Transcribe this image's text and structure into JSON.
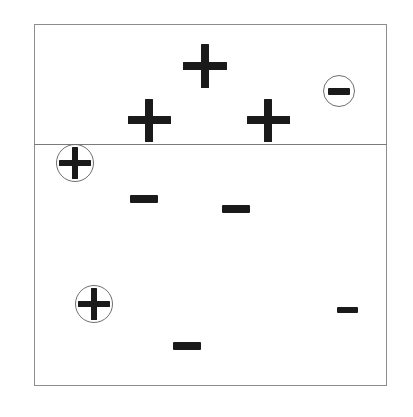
{
  "figure": {
    "width": 413,
    "height": 417,
    "background_color": "#ffffff",
    "ink_color": "#1a1a1a",
    "frame_color": "#8d8d8d",
    "boundary_color": "#7a7a7a",
    "ring_color": "#6f6f6f"
  },
  "frame": {
    "label": "plot-frame",
    "x": 34,
    "y": 24,
    "width": 353,
    "height": 362,
    "border_width": 1.4
  },
  "decision_boundary": {
    "label": "decision-boundary",
    "orientation": "horizontal",
    "x": 34,
    "y": 144,
    "width": 353,
    "thickness": 1.4
  },
  "regions": [
    {
      "name": "positive-region",
      "label": "above-boundary"
    },
    {
      "name": "negative-region",
      "label": "below-boundary"
    }
  ],
  "markers": [
    {
      "id": "plus-1",
      "sign": "+",
      "semantic": "positive-example",
      "region": "positive-region",
      "cx": 205,
      "cy": 66,
      "size": 44,
      "stroke": 8,
      "circled": false,
      "ring_radius": 0
    },
    {
      "id": "plus-2",
      "sign": "+",
      "semantic": "positive-example",
      "region": "positive-region",
      "cx": 149,
      "cy": 120,
      "size": 43,
      "stroke": 8,
      "circled": false,
      "ring_radius": 0
    },
    {
      "id": "plus-3",
      "sign": "+",
      "semantic": "positive-example",
      "region": "positive-region",
      "cx": 268,
      "cy": 120,
      "size": 43,
      "stroke": 8,
      "circled": false,
      "ring_radius": 0
    },
    {
      "id": "minus-circled-1",
      "sign": "−",
      "semantic": "negative-example-misclassified",
      "region": "positive-region",
      "cx": 339,
      "cy": 91,
      "size": 22,
      "stroke": 7,
      "circled": true,
      "ring_radius": 16
    },
    {
      "id": "plus-circled-1",
      "sign": "+",
      "semantic": "positive-example-highlighted",
      "region": "negative-region",
      "cx": 75,
      "cy": 163,
      "size": 32,
      "stroke": 6,
      "circled": true,
      "ring_radius": 19
    },
    {
      "id": "minus-1",
      "sign": "−",
      "semantic": "negative-example",
      "region": "negative-region",
      "cx": 144,
      "cy": 199,
      "size": 28,
      "stroke": 8,
      "circled": false,
      "ring_radius": 0
    },
    {
      "id": "minus-2",
      "sign": "−",
      "semantic": "negative-example",
      "region": "negative-region",
      "cx": 236,
      "cy": 209,
      "size": 28,
      "stroke": 8,
      "circled": false,
      "ring_radius": 0
    },
    {
      "id": "plus-circled-2",
      "sign": "+",
      "semantic": "positive-example-highlighted",
      "region": "negative-region",
      "cx": 94,
      "cy": 304,
      "size": 32,
      "stroke": 6,
      "circled": true,
      "ring_radius": 19
    },
    {
      "id": "minus-3",
      "sign": "−",
      "semantic": "negative-example",
      "region": "negative-region",
      "cx": 347,
      "cy": 310,
      "size": 21,
      "stroke": 6,
      "circled": false,
      "ring_radius": 0
    },
    {
      "id": "minus-4",
      "sign": "−",
      "semantic": "negative-example",
      "region": "negative-region",
      "cx": 187,
      "cy": 346,
      "size": 28,
      "stroke": 8,
      "circled": false,
      "ring_radius": 0
    }
  ],
  "counts": {
    "plus_total": 5,
    "minus_total": 5,
    "circled_total": 3
  }
}
